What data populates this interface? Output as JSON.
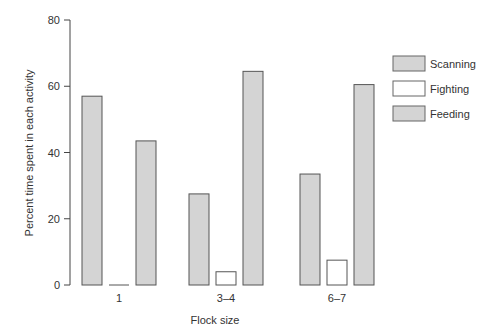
{
  "chart_data": {
    "type": "bar",
    "title": "",
    "xlabel": "Flock size",
    "ylabel": "Percent time spent in each activity",
    "categories": [
      "1",
      "3–4",
      "6–7"
    ],
    "series": [
      {
        "name": "Scanning",
        "values": [
          57,
          27.5,
          33.5
        ],
        "color": "#d4d4d4"
      },
      {
        "name": "Fighting",
        "values": [
          0,
          4,
          7.5
        ],
        "color": "#ffffff"
      },
      {
        "name": "Feeding",
        "values": [
          43.5,
          64.5,
          60.5
        ],
        "color": "#d4d4d4"
      }
    ],
    "ylim": [
      0,
      80
    ],
    "yticks": [
      0,
      20,
      40,
      60,
      80
    ],
    "grid": false,
    "legend_position": "right"
  }
}
